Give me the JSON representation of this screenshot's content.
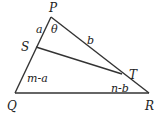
{
  "diagram": {
    "type": "triangle",
    "vertices": {
      "P": "P",
      "Q": "Q",
      "R": "R",
      "S": "S",
      "T": "T"
    },
    "segments": {
      "PS": "a",
      "PT": "b",
      "SQ": "m-a",
      "TR": "n-b"
    },
    "angle": "θ",
    "edges": [
      "PQ",
      "PR",
      "QR",
      "ST"
    ]
  }
}
